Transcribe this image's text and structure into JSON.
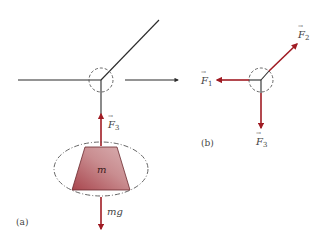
{
  "figure": {
    "panels": [
      {
        "id": "a",
        "label": "(a)"
      },
      {
        "id": "b",
        "label": "(b)"
      }
    ],
    "mass_label": "m",
    "weight_label": "mg",
    "forces": [
      {
        "name": "F",
        "sub": "1"
      },
      {
        "name": "F",
        "sub": "2"
      },
      {
        "name": "F",
        "sub": "3"
      }
    ],
    "colors": {
      "force_arrow": "#a01c24",
      "line": "#2b2b2b",
      "dashed": "#555555",
      "mass_light": "#d9a9ab",
      "mass_dark": "#a8454d"
    }
  }
}
